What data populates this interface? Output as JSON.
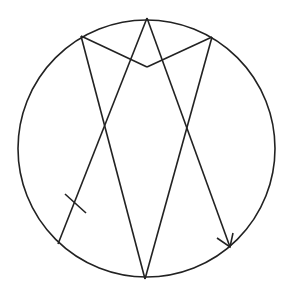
{
  "diagram": {
    "stroke_color": "#222222",
    "background": "#ffffff",
    "circle": {
      "cx": 146.5,
      "cy": 148.5,
      "r": 128.5
    },
    "points": {
      "top": [
        147,
        18
      ],
      "upper_left": [
        81,
        36
      ],
      "upper_right": [
        212,
        37
      ],
      "v_bottom": [
        147,
        67
      ],
      "bottom": [
        145,
        279
      ],
      "lower_left": [
        58,
        244
      ],
      "lower_right": [
        230,
        247
      ]
    },
    "segments": [
      {
        "name": "upper-left-to-v",
        "from": "upper_left",
        "to": "v_bottom"
      },
      {
        "name": "v-to-upper-right",
        "from": "v_bottom",
        "to": "upper_right"
      },
      {
        "name": "lower-left-to-top",
        "from": "lower_left",
        "to": "top"
      },
      {
        "name": "top-to-lower-right",
        "from": "top",
        "to": "lower_right"
      },
      {
        "name": "upper-left-to-bottom",
        "from": "upper_left",
        "to": "bottom"
      },
      {
        "name": "bottom-to-upper-right",
        "from": "bottom",
        "to": "upper_right"
      }
    ],
    "tick_mark": {
      "from": [
        65,
        194
      ],
      "to": [
        86,
        213
      ]
    },
    "arrowhead": {
      "tip": [
        230,
        247
      ],
      "wing1": [
        217,
        238
      ],
      "wing2": [
        233,
        233
      ]
    }
  }
}
